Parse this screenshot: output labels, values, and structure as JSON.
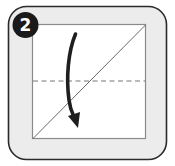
{
  "step": {
    "number": "2",
    "badge_color": "#1a1a1a",
    "badge_text_color": "#ffffff"
  },
  "frame": {
    "fill": "#ececec",
    "stroke": "#2a2a2a"
  },
  "paper": {
    "fill": "#ffffff",
    "stroke": "#8a8a8a"
  },
  "lines": {
    "diagonal_crease": {
      "from": [
        32,
        139
      ],
      "to": [
        146,
        24
      ],
      "style": "solid"
    },
    "valley_fold": {
      "y": 81,
      "style": "dashed"
    }
  },
  "arrow": {
    "direction": "down",
    "meaning": "fold top edge down to bottom",
    "color": "#1e1e1e"
  }
}
